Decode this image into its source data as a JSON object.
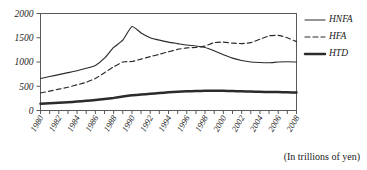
{
  "chart_data": {
    "type": "line",
    "title": "",
    "xlabel": "",
    "ylabel": "",
    "note": "(In trillions of yen)",
    "units": "trillions of yen",
    "grid": false,
    "legend_position": "right",
    "ylim": [
      0,
      2000
    ],
    "ytick_values": [
      0,
      500,
      1000,
      1500,
      2000
    ],
    "ytick_labels": [
      "0",
      "500",
      "1000",
      "1500",
      "2000"
    ],
    "xlim": [
      1980,
      2008
    ],
    "x": [
      1980,
      1981,
      1982,
      1983,
      1984,
      1985,
      1986,
      1987,
      1988,
      1989,
      1990,
      1991,
      1992,
      1993,
      1994,
      1995,
      1996,
      1997,
      1998,
      1999,
      2000,
      2001,
      2002,
      2003,
      2004,
      2005,
      2006,
      2007,
      2008
    ],
    "xtick_values": [
      1980,
      1981,
      1982,
      1983,
      1984,
      1985,
      1986,
      1987,
      1988,
      1989,
      1990,
      1991,
      1992,
      1993,
      1994,
      1995,
      1996,
      1997,
      1998,
      1999,
      2000,
      2001,
      2002,
      2003,
      2004,
      2005,
      2006,
      2007,
      2008
    ],
    "xtick_labels": [
      "1980",
      "1982",
      "1984",
      "1986",
      "1988",
      "1990",
      "1992",
      "1994",
      "1996",
      "1998",
      "2000",
      "2002",
      "2004",
      "2006",
      "2008"
    ],
    "xtick_label_values": [
      1980,
      1982,
      1984,
      1986,
      1988,
      1990,
      1992,
      1994,
      1996,
      1998,
      2000,
      2002,
      2004,
      2006,
      2008
    ],
    "series": [
      {
        "name": "HNFA",
        "style": "solid-thin",
        "color": "#2b2b2b",
        "values": [
          660,
          700,
          740,
          780,
          820,
          870,
          930,
          1080,
          1300,
          1450,
          1730,
          1600,
          1500,
          1450,
          1410,
          1380,
          1350,
          1330,
          1300,
          1230,
          1150,
          1080,
          1030,
          1000,
          990,
          985,
          1000,
          1005,
          1000
        ]
      },
      {
        "name": "HFA",
        "style": "dashed",
        "color": "#2b2b2b",
        "values": [
          360,
          400,
          440,
          480,
          530,
          580,
          660,
          780,
          900,
          1000,
          1010,
          1060,
          1110,
          1160,
          1210,
          1260,
          1290,
          1300,
          1330,
          1400,
          1410,
          1390,
          1380,
          1400,
          1470,
          1540,
          1550,
          1500,
          1420
        ]
      },
      {
        "name": "HTD",
        "style": "solid-thick",
        "color": "#2b2b2b",
        "values": [
          140,
          150,
          160,
          170,
          185,
          200,
          215,
          235,
          260,
          290,
          315,
          330,
          345,
          360,
          375,
          385,
          395,
          400,
          405,
          405,
          405,
          400,
          395,
          390,
          385,
          382,
          380,
          375,
          370
        ]
      }
    ],
    "legend": [
      {
        "label": "HNFA",
        "style": "solid-thin"
      },
      {
        "label": "HFA",
        "style": "dashed"
      },
      {
        "label": "HTD",
        "style": "solid-thick"
      }
    ]
  }
}
